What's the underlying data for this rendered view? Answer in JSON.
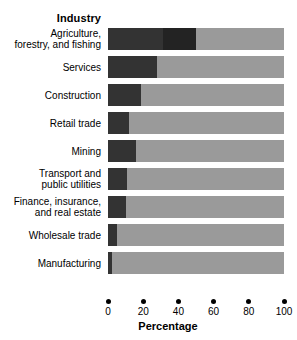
{
  "chart_data": {
    "type": "bar",
    "orientation": "horizontal",
    "title": "",
    "xlabel": "Percentage",
    "ylabel": "Industry",
    "xlim": [
      0,
      100
    ],
    "xticks": [
      0,
      20,
      40,
      60,
      80,
      100
    ],
    "xtick_labels": [
      "0",
      "20",
      "40",
      "60",
      "80",
      "100"
    ],
    "grid": false,
    "legend": "none",
    "categories": [
      "Agriculture, forestry, and fishing",
      "Services",
      "Construction",
      "Retail trade",
      "Mining",
      "Transport and public utilities",
      "Finance, insurance, and real estate",
      "Wholesale trade",
      "Manufacturing"
    ],
    "values": [
      50,
      28,
      19,
      12,
      16,
      11,
      10,
      5,
      2
    ],
    "colors": {
      "bar_fill": "#333333",
      "bar_fill_inner": "#232323",
      "track": "#9a9a9a",
      "background": "#ffffff",
      "text": "#000000"
    }
  },
  "axes": {
    "y_title": "Industry",
    "x_title": "Percentage"
  },
  "rows": [
    {
      "label_line1": "Agriculture,",
      "label_line2": "forestry, and fishing",
      "value": 50
    },
    {
      "label_line1": "Services",
      "label_line2": "",
      "value": 28
    },
    {
      "label_line1": "Construction",
      "label_line2": "",
      "value": 19
    },
    {
      "label_line1": "Retail trade",
      "label_line2": "",
      "value": 12
    },
    {
      "label_line1": "Mining",
      "label_line2": "",
      "value": 16
    },
    {
      "label_line1": "Transport and",
      "label_line2": "public utilities",
      "value": 11
    },
    {
      "label_line1": "Finance, insurance,",
      "label_line2": "and real estate",
      "value": 10
    },
    {
      "label_line1": "Wholesale trade",
      "label_line2": "",
      "value": 5
    },
    {
      "label_line1": "Manufacturing",
      "label_line2": "",
      "value": 2
    }
  ],
  "xticks": [
    {
      "value": 0,
      "label": "0"
    },
    {
      "value": 20,
      "label": "20"
    },
    {
      "value": 40,
      "label": "40"
    },
    {
      "value": 60,
      "label": "60"
    },
    {
      "value": 80,
      "label": "80"
    },
    {
      "value": 100,
      "label": "100"
    }
  ]
}
